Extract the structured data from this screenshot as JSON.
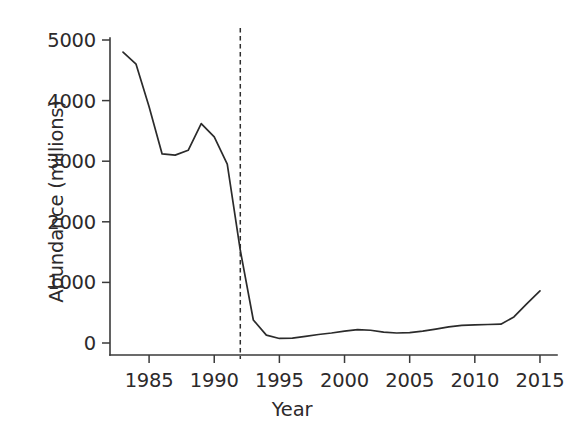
{
  "chart_data": {
    "type": "line",
    "title": "",
    "xlabel": "Year",
    "ylabel": "Abundance (millions)",
    "xlim": [
      1982.0,
      2016.0
    ],
    "ylim": [
      -300,
      5150
    ],
    "grid": false,
    "legend": "none",
    "xticks": [
      1985,
      1990,
      1995,
      2000,
      2005,
      2010,
      2015
    ],
    "xtick_labels": [
      "1985",
      "1990",
      "1995",
      "2000",
      "2005",
      "2010",
      "2015"
    ],
    "yticks": [
      0,
      1000,
      2000,
      3000,
      4000,
      5000
    ],
    "ytick_labels": [
      "0",
      "1000",
      "2000",
      "3000",
      "4000",
      "5000"
    ],
    "series": [
      {
        "name": "Abundance",
        "color": "#2b2b2b",
        "x": [
          1983,
          1984,
          1985,
          1986,
          1987,
          1988,
          1989,
          1990,
          1991,
          1992,
          1993,
          1994,
          1995,
          1996,
          1997,
          1998,
          1999,
          2000,
          2001,
          2002,
          2003,
          2004,
          2005,
          2006,
          2007,
          2008,
          2009,
          2010,
          2011,
          2012,
          2013,
          2014,
          2015
        ],
        "y": [
          4800,
          4600,
          3900,
          3120,
          3100,
          3180,
          3620,
          3400,
          2950,
          1530,
          380,
          130,
          75,
          80,
          110,
          140,
          165,
          195,
          220,
          210,
          180,
          165,
          170,
          195,
          230,
          265,
          290,
          300,
          305,
          310,
          430,
          650,
          860
        ]
      }
    ],
    "annotations": [
      {
        "name": "moratorium-line",
        "type": "vline",
        "x": 1992,
        "style": "dashed",
        "color": "#2f2f2f",
        "label": ""
      }
    ]
  },
  "axes": {
    "x_title": "Year",
    "y_title": "Abundance (millions)"
  }
}
